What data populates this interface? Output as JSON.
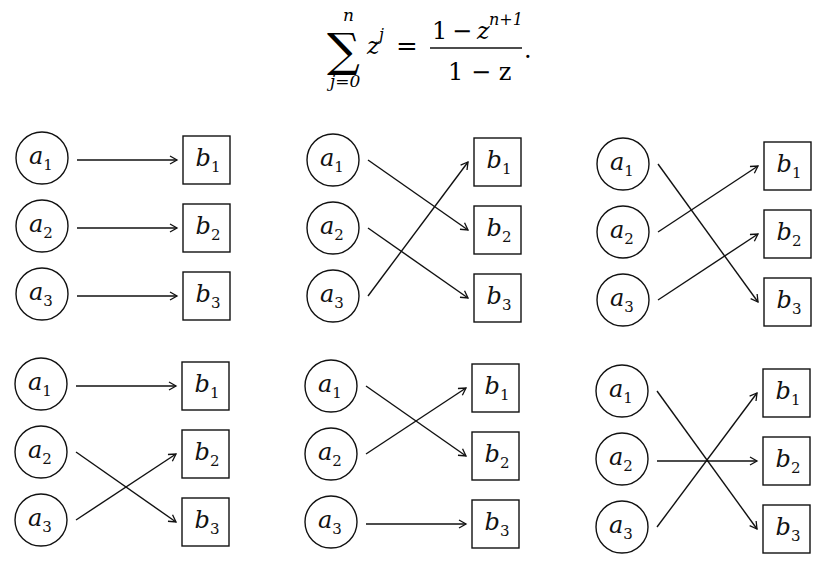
{
  "formula": {
    "latex": "\\sum_{j=0}^{n} z^j = \\frac{1 - z^{n+1}}{1 - z}.",
    "sum_symbol": "∑",
    "upper_limit": "n",
    "lower_limit": "j=0",
    "summand_base": "z",
    "summand_exp": "j",
    "equals": "=",
    "numerator_one": "1",
    "numerator_minus": "−",
    "numerator_base": "z",
    "numerator_exp": "n+1",
    "denominator": "1 − z",
    "trailing_punct": "."
  },
  "colors": {
    "ink": "#111111",
    "background": "#ffffff"
  },
  "node_labels": {
    "sources": [
      {
        "base": "a",
        "sub": "1"
      },
      {
        "base": "a",
        "sub": "2"
      },
      {
        "base": "a",
        "sub": "3"
      }
    ],
    "targets": [
      {
        "base": "b",
        "sub": "1"
      },
      {
        "base": "b",
        "sub": "2"
      },
      {
        "base": "b",
        "sub": "3"
      }
    ]
  },
  "diagrams": [
    {
      "id": "top-left",
      "origin": [
        42,
        158
      ],
      "mapping": [
        1,
        2,
        3
      ],
      "description": "identity: a1→b1, a2→b2, a3→b3"
    },
    {
      "id": "top-middle",
      "origin": [
        333,
        160
      ],
      "mapping": [
        2,
        3,
        1
      ],
      "description": "a1→b2, a2→b3, a3→b1"
    },
    {
      "id": "top-right",
      "origin": [
        623,
        164
      ],
      "mapping": [
        3,
        1,
        2
      ],
      "description": "a1→b3, a2→b1, a3→b2"
    },
    {
      "id": "bottom-left",
      "origin": [
        41,
        384
      ],
      "mapping": [
        1,
        3,
        2
      ],
      "description": "a1→b1, a2→b3, a3→b2"
    },
    {
      "id": "bottom-middle",
      "origin": [
        331,
        386
      ],
      "mapping": [
        2,
        1,
        3
      ],
      "description": "a1→b2, a2→b1, a3→b3"
    },
    {
      "id": "bottom-right",
      "origin": [
        622,
        391
      ],
      "mapping": [
        3,
        2,
        1
      ],
      "description": "a1→b3, a2→b2, a3→b1"
    }
  ],
  "geometry": {
    "row_spacing": 68,
    "circle_radius": 26,
    "box_offset_x": 141,
    "box_width": 47,
    "box_height": 48,
    "arrow_start_dx": 35,
    "arrow_end_gap": 6
  }
}
